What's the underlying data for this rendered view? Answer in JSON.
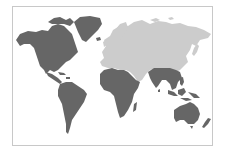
{
  "figure": {
    "type": "world-map",
    "caption": "",
    "colors": {
      "highlighted": "#666666",
      "other": "#cccccc",
      "background": "#ffffff",
      "border": "#c8c8c8"
    },
    "regions": [
      {
        "name": "North America",
        "shade": "dark"
      },
      {
        "name": "Greenland",
        "shade": "dark"
      },
      {
        "name": "Central America & Caribbean",
        "shade": "dark"
      },
      {
        "name": "South America",
        "shade": "dark"
      },
      {
        "name": "Africa",
        "shade": "dark"
      },
      {
        "name": "South & Southeast Asia",
        "shade": "dark"
      },
      {
        "name": "Indonesia & Philippines",
        "shade": "dark"
      },
      {
        "name": "Australia",
        "shade": "dark"
      },
      {
        "name": "New Zealand",
        "shade": "dark"
      },
      {
        "name": "Madagascar",
        "shade": "dark"
      },
      {
        "name": "Europe",
        "shade": "light"
      },
      {
        "name": "Russia & North Asia",
        "shade": "light"
      },
      {
        "name": "Middle East & Central Asia",
        "shade": "light"
      },
      {
        "name": "China & East Asia",
        "shade": "light"
      },
      {
        "name": "Japan",
        "shade": "light"
      }
    ]
  }
}
